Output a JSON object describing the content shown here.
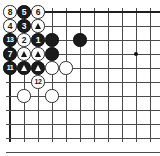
{
  "diagram": {
    "kind": "go-board-diagram",
    "board": {
      "columns": 10,
      "rows": 10,
      "cell_px": 14,
      "origin_x": 10,
      "origin_y": 12,
      "line_color": "#4a4a4a",
      "edge_color": "#1f1f1f",
      "background": "#ffffff",
      "grid_visible": true
    },
    "colors": {
      "black_stone": "#1b1b1b",
      "white_stone": "#fdfdfd",
      "black_label": "#ffffff",
      "white_label": "#161616",
      "star_point": "#111111"
    },
    "star_points": [
      {
        "col": 9,
        "row": 3,
        "name": "star-point-right"
      }
    ],
    "stones": [
      {
        "id": "w8",
        "col": 0,
        "row": 0,
        "color": "white",
        "label": "8",
        "mark": "none"
      },
      {
        "id": "b5",
        "col": 1,
        "row": 0,
        "color": "black",
        "label": "5",
        "mark": "none"
      },
      {
        "id": "w6",
        "col": 2,
        "row": 0,
        "color": "white",
        "label": "6",
        "mark": "none"
      },
      {
        "id": "w4",
        "col": 0,
        "row": 1,
        "color": "white",
        "label": "4",
        "mark": "none"
      },
      {
        "id": "b3",
        "col": 1,
        "row": 1,
        "color": "black",
        "label": "3",
        "mark": "none"
      },
      {
        "id": "wt1",
        "col": 2,
        "row": 1,
        "color": "white",
        "label": "",
        "mark": "triangle"
      },
      {
        "id": "b13",
        "col": 0,
        "row": 2,
        "color": "black",
        "label": "13",
        "mark": "none"
      },
      {
        "id": "w2",
        "col": 1,
        "row": 2,
        "color": "white",
        "label": "2",
        "mark": "none"
      },
      {
        "id": "b1",
        "col": 2,
        "row": 2,
        "color": "black",
        "label": "1",
        "mark": "none"
      },
      {
        "id": "bp1",
        "col": 3,
        "row": 2,
        "color": "black",
        "label": "",
        "mark": "none"
      },
      {
        "id": "bp2",
        "col": 5,
        "row": 2,
        "color": "black",
        "label": "",
        "mark": "none"
      },
      {
        "id": "b7",
        "col": 0,
        "row": 3,
        "color": "black",
        "label": "7",
        "mark": "none"
      },
      {
        "id": "wt2",
        "col": 1,
        "row": 3,
        "color": "white",
        "label": "",
        "mark": "triangle"
      },
      {
        "id": "wt3",
        "col": 2,
        "row": 3,
        "color": "white",
        "label": "",
        "mark": "triangle"
      },
      {
        "id": "bp3",
        "col": 3,
        "row": 3,
        "color": "black",
        "label": "",
        "mark": "none"
      },
      {
        "id": "b11",
        "col": 0,
        "row": 4,
        "color": "black",
        "label": "11",
        "mark": "none"
      },
      {
        "id": "bt1",
        "col": 1,
        "row": 4,
        "color": "black",
        "label": "",
        "mark": "triangle-white"
      },
      {
        "id": "bt2",
        "col": 2,
        "row": 4,
        "color": "black",
        "label": "",
        "mark": "triangle-white"
      },
      {
        "id": "wp1",
        "col": 3,
        "row": 4,
        "color": "white",
        "label": "",
        "mark": "none"
      },
      {
        "id": "wp2",
        "col": 4,
        "row": 4,
        "color": "white",
        "label": "",
        "mark": "none"
      },
      {
        "id": "w12",
        "col": 2,
        "row": 5,
        "color": "white",
        "label": "12",
        "mark": "none"
      },
      {
        "id": "wp3",
        "col": 1,
        "row": 6,
        "color": "white",
        "label": "",
        "mark": "none"
      },
      {
        "id": "wp4",
        "col": 3,
        "row": 6,
        "color": "white",
        "label": "",
        "mark": "none"
      }
    ],
    "move_order": [
      "1",
      "2",
      "3",
      "4",
      "5",
      "6",
      "7",
      "8",
      "11",
      "12",
      "13"
    ]
  }
}
